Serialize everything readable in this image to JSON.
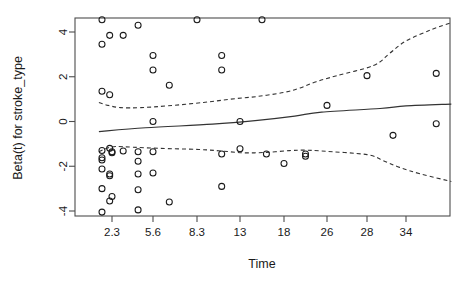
{
  "chart_data": {
    "type": "scatter",
    "title": "",
    "xlabel": "Time",
    "ylabel": "Beta(t) for stroke_type",
    "grid": false,
    "legend": "none",
    "x_tick_labels": [
      "2.3",
      "5.6",
      "8.3",
      "13",
      "18",
      "26",
      "28",
      "34"
    ],
    "x_tick_positions": [
      2.3,
      5.6,
      8.3,
      13,
      18,
      26,
      28,
      34
    ],
    "y_tick_labels": [
      "4",
      "2",
      "0",
      "-2",
      "-4"
    ],
    "y_tick_values": [
      4,
      2,
      0,
      -2,
      -4
    ],
    "xlim": [
      0.6,
      38.5
    ],
    "ylim": [
      -4.55,
      5.0
    ],
    "series": [
      {
        "name": "Scaled Schoenfeld residuals",
        "marker": "open-circle",
        "points": [
          [
            1.0,
            4.55
          ],
          [
            1.0,
            3.45
          ],
          [
            1.0,
            1.35
          ],
          [
            1.0,
            -1.3
          ],
          [
            1.0,
            -1.62
          ],
          [
            1.0,
            -1.72
          ],
          [
            1.0,
            -2.12
          ],
          [
            1.0,
            -3.0
          ],
          [
            1.0,
            -4.05
          ],
          [
            2.0,
            3.85
          ],
          [
            2.0,
            1.2
          ],
          [
            2.0,
            -1.2
          ],
          [
            2.0,
            -2.35
          ],
          [
            2.0,
            -2.42
          ],
          [
            2.0,
            -3.55
          ],
          [
            2.3,
            -1.35
          ],
          [
            2.3,
            -1.4
          ],
          [
            2.3,
            -3.35
          ],
          [
            3.2,
            3.85
          ],
          [
            3.2,
            -1.32
          ],
          [
            4.4,
            4.3
          ],
          [
            4.4,
            -1.35
          ],
          [
            4.4,
            -1.78
          ],
          [
            4.4,
            -2.35
          ],
          [
            4.4,
            -3.05
          ],
          [
            4.4,
            -3.95
          ],
          [
            5.6,
            2.95
          ],
          [
            5.6,
            2.3
          ],
          [
            5.6,
            0.0
          ],
          [
            5.6,
            -1.35
          ],
          [
            5.6,
            -2.3
          ],
          [
            6.6,
            1.62
          ],
          [
            6.6,
            -3.6
          ],
          [
            8.3,
            4.55
          ],
          [
            11.0,
            2.95
          ],
          [
            11.0,
            2.3
          ],
          [
            11.0,
            -1.45
          ],
          [
            11.0,
            -2.9
          ],
          [
            13.0,
            0.0
          ],
          [
            13.0,
            -1.22
          ],
          [
            15.5,
            4.55
          ],
          [
            16.0,
            -1.45
          ],
          [
            18.0,
            -1.88
          ],
          [
            22.0,
            -1.45
          ],
          [
            22.0,
            -1.55
          ],
          [
            26.0,
            0.72
          ],
          [
            28.0,
            2.05
          ],
          [
            32.0,
            -0.62
          ],
          [
            37.0,
            2.15
          ],
          [
            37.0,
            -0.1
          ]
        ]
      }
    ],
    "fit_line": {
      "name": "smoothed beta(t)",
      "style": "solid",
      "points": [
        [
          0.6,
          -0.45
        ],
        [
          5.0,
          -0.28
        ],
        [
          10.0,
          -0.12
        ],
        [
          15.0,
          0.05
        ],
        [
          20.0,
          0.24
        ],
        [
          25.0,
          0.42
        ],
        [
          30.0,
          0.58
        ],
        [
          34.0,
          0.7
        ],
        [
          38.5,
          0.78
        ]
      ]
    },
    "confidence_bands": [
      {
        "name": "upper 95% band",
        "style": "dashed",
        "points": [
          [
            0.6,
            0.85
          ],
          [
            1.8,
            0.72
          ],
          [
            3.0,
            0.62
          ],
          [
            4.6,
            0.62
          ],
          [
            6.5,
            0.7
          ],
          [
            9.0,
            0.85
          ],
          [
            12.0,
            1.0
          ],
          [
            15.0,
            1.12
          ],
          [
            18.0,
            1.3
          ],
          [
            21.0,
            1.5
          ],
          [
            24.0,
            1.78
          ],
          [
            26.5,
            2.05
          ],
          [
            29.0,
            2.5
          ],
          [
            31.5,
            3.05
          ],
          [
            34.0,
            3.6
          ],
          [
            36.5,
            4.1
          ],
          [
            38.5,
            4.42
          ]
        ]
      },
      {
        "name": "lower 95% band",
        "style": "dashed",
        "points": [
          [
            0.6,
            -1.35
          ],
          [
            1.6,
            -1.2
          ],
          [
            2.6,
            -1.12
          ],
          [
            4.0,
            -1.15
          ],
          [
            6.0,
            -1.2
          ],
          [
            8.5,
            -1.25
          ],
          [
            11.0,
            -1.32
          ],
          [
            13.5,
            -1.4
          ],
          [
            16.0,
            -1.38
          ],
          [
            19.0,
            -1.3
          ],
          [
            22.0,
            -1.28
          ],
          [
            25.0,
            -1.32
          ],
          [
            28.0,
            -1.48
          ],
          [
            30.5,
            -1.75
          ],
          [
            33.0,
            -2.05
          ],
          [
            35.5,
            -2.35
          ],
          [
            38.5,
            -2.68
          ]
        ]
      }
    ]
  },
  "axis": {
    "x_title": "Time",
    "y_title": "Beta(t) for stroke_type"
  }
}
